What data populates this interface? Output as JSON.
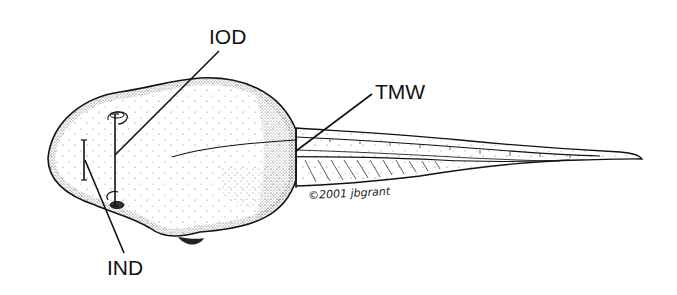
{
  "figure": {
    "labels": {
      "iod": "IOD",
      "tmw": "TMW",
      "ind": "IND"
    },
    "signature": "©2001 jbgrant"
  }
}
